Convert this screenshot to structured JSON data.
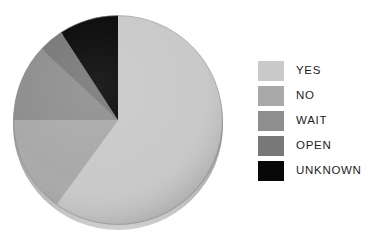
{
  "chart_data": {
    "type": "pie",
    "title": "",
    "xlabel": "",
    "ylabel": "",
    "categories": [
      "YES",
      "NO",
      "WAIT",
      "OPEN",
      "UNKNOWN"
    ],
    "values": [
      60,
      15,
      12,
      4,
      9
    ],
    "units": "percent",
    "start_angle_deg": 0,
    "direction": "clockwise",
    "legend_position": "right",
    "grid": false,
    "slices": [
      {
        "label": "YES",
        "value": 60,
        "color": "#c9c9c9",
        "start_deg": 0,
        "end_deg": 216
      },
      {
        "label": "NO",
        "value": 15,
        "color": "#a9a9a9",
        "start_deg": 216,
        "end_deg": 270
      },
      {
        "label": "WAIT",
        "value": 12,
        "color": "#8e8e8e",
        "start_deg": 270,
        "end_deg": 313
      },
      {
        "label": "OPEN",
        "value": 4,
        "color": "#787878",
        "start_deg": 313,
        "end_deg": 327
      },
      {
        "label": "UNKNOWN",
        "value": 9,
        "color": "#080808",
        "start_deg": 327,
        "end_deg": 360
      }
    ]
  },
  "legend": {
    "items": [
      {
        "label": "YES",
        "color": "#c9c9c9"
      },
      {
        "label": "NO",
        "color": "#a9a9a9"
      },
      {
        "label": "WAIT",
        "color": "#8e8e8e"
      },
      {
        "label": "OPEN",
        "color": "#787878"
      },
      {
        "label": "UNKNOWN",
        "color": "#080808"
      }
    ]
  }
}
